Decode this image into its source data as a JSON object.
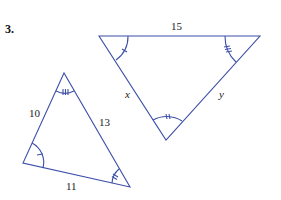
{
  "problem": {
    "number": "3."
  },
  "colors": {
    "line": "#3d4fa8",
    "text": "#222222"
  },
  "triangle_large": {
    "vertices": {
      "top_left": [
        99,
        36
      ],
      "top_right": [
        260,
        36
      ],
      "bottom": [
        166,
        140
      ]
    },
    "labels": {
      "top_side": "15",
      "left_side": "x",
      "right_side": "y"
    },
    "angle_marks": {
      "top_left": "single tick",
      "top_right": "triple tick",
      "bottom": "double tick"
    }
  },
  "triangle_small": {
    "vertices": {
      "apex": [
        64,
        73
      ],
      "bottom_left": [
        23,
        163
      ],
      "bottom_right": [
        130,
        187
      ]
    },
    "labels": {
      "left_side": "10",
      "right_side": "13",
      "bottom_side": "11"
    },
    "angle_marks": {
      "apex": "triple tick",
      "bottom_left": "single tick",
      "bottom_right": "double tick"
    }
  }
}
